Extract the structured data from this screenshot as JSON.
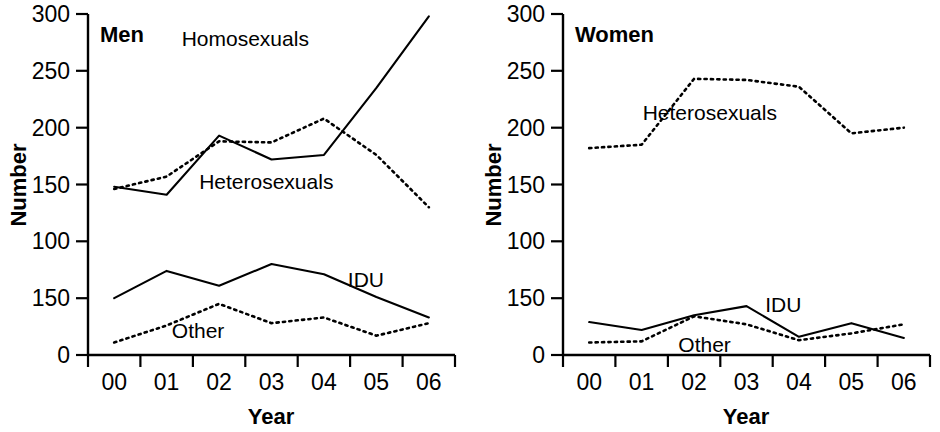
{
  "figure": {
    "background": "#ffffff",
    "ink_color": "#000000",
    "panel_count": 2
  },
  "chart_data": [
    {
      "type": "line",
      "title": "Men",
      "xlabel": "Year",
      "ylabel": "Number",
      "x": [
        "00",
        "01",
        "02",
        "03",
        "04",
        "05",
        "06"
      ],
      "xtick_labels": [
        "00",
        "01",
        "02",
        "03",
        "04",
        "05",
        "06"
      ],
      "ytick_labels": [
        "0",
        "150",
        "100",
        "150",
        "200",
        "250",
        "300"
      ],
      "ytick_values": [
        0,
        50,
        100,
        150,
        200,
        250,
        300
      ],
      "ylim": [
        0,
        300
      ],
      "grid": false,
      "legend_position": "inline-annotations",
      "series": [
        {
          "name": "Homosexuals",
          "style": "solid",
          "label_x": "02.5",
          "label_y": 278,
          "values": [
            148,
            141,
            193,
            172,
            176,
            235,
            298
          ]
        },
        {
          "name": "Heterosexuals",
          "style": "dotted",
          "label_x": "02.9",
          "label_y": 152,
          "values": [
            146,
            157,
            188,
            187,
            208,
            176,
            130
          ]
        },
        {
          "name": "IDU",
          "style": "solid",
          "label_x": "04.8",
          "label_y": 66,
          "values": [
            50,
            74,
            61,
            80,
            71,
            51,
            33
          ]
        },
        {
          "name": "Other",
          "style": "dotted",
          "label_x": "01.6",
          "label_y": 21,
          "values": [
            11,
            26,
            45,
            28,
            33,
            17,
            28
          ]
        }
      ]
    },
    {
      "type": "line",
      "title": "Women",
      "xlabel": "Year",
      "ylabel": "Number",
      "x": [
        "00",
        "01",
        "02",
        "03",
        "04",
        "05",
        "06"
      ],
      "xtick_labels": [
        "00",
        "01",
        "02",
        "03",
        "04",
        "05",
        "06"
      ],
      "ytick_labels": [
        "0",
        "150",
        "100",
        "150",
        "200",
        "250",
        "300"
      ],
      "ytick_values": [
        0,
        50,
        100,
        150,
        200,
        250,
        300
      ],
      "ylim": [
        0,
        300
      ],
      "grid": false,
      "legend_position": "inline-annotations",
      "series": [
        {
          "name": "Heterosexuals",
          "style": "dotted",
          "label_x": "02.3",
          "label_y": 213,
          "values": [
            182,
            185,
            243,
            242,
            236,
            195,
            200
          ]
        },
        {
          "name": "IDU",
          "style": "solid",
          "label_x": "03.7",
          "label_y": 44,
          "values": [
            29,
            22,
            35,
            43,
            16,
            28,
            15
          ]
        },
        {
          "name": "Other",
          "style": "dotted",
          "label_x": "02.2",
          "label_y": 9,
          "values": [
            11,
            12,
            34,
            27,
            13,
            19,
            27
          ]
        }
      ]
    }
  ]
}
